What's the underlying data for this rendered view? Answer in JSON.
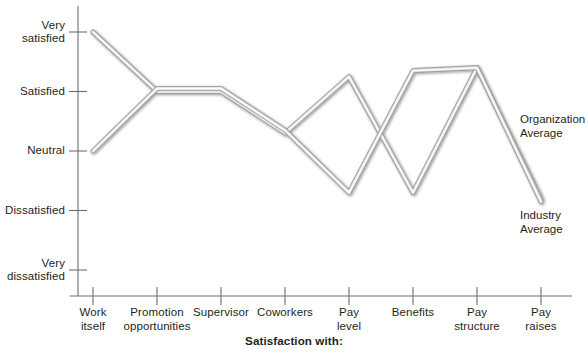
{
  "chart_data": {
    "type": "line",
    "title": "",
    "xlabel": "Satisfaction with:",
    "ylabel": "",
    "categories": [
      "Work\nitself",
      "Promotion\nopportunities",
      "Supervisor",
      "Coworkers",
      "Pay\nlevel",
      "Benefits",
      "Pay\nstructure",
      "Pay\nraises"
    ],
    "ytick_labels": [
      "Very\nsatisfied",
      "Satisfied",
      "Neutral",
      "Dissatisfied",
      "Very\ndissatisfied"
    ],
    "ytick_values": [
      5,
      4,
      3,
      2,
      1
    ],
    "ylim": [
      1,
      5
    ],
    "grid": false,
    "legend_position": "right-inline",
    "series": [
      {
        "name": "Organization\nAverage",
        "label_short": "Organization Average",
        "color": "#8a8a8d",
        "values": [
          5.0,
          4.0,
          4.0,
          3.3,
          4.25,
          2.3,
          4.4,
          2.2
        ]
      },
      {
        "name": "Industry\nAverage",
        "label_short": "Industry Average",
        "color": "#8a8a8d",
        "values": [
          3.0,
          4.05,
          4.05,
          3.35,
          2.3,
          4.35,
          4.4,
          2.15
        ]
      }
    ]
  },
  "axis": {
    "x_title": "Satisfaction with:"
  },
  "colors": {
    "axis": "#6d6e71",
    "line": "#8a8a8d",
    "text": "#231f20",
    "background": "#ffffff"
  }
}
